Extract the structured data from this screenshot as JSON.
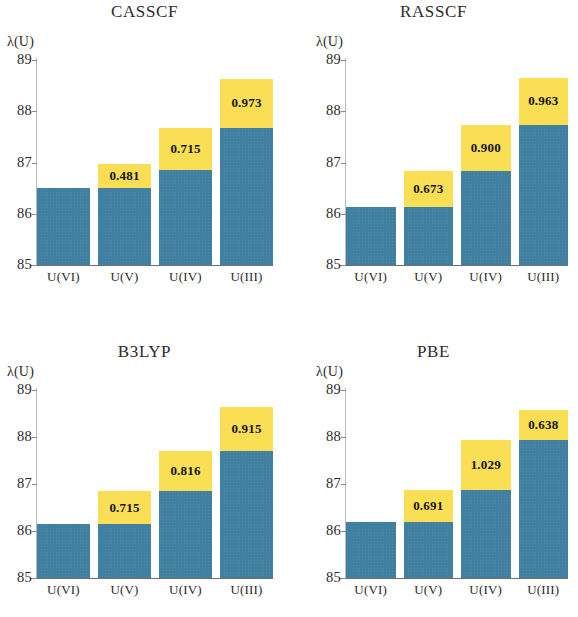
{
  "figure": {
    "ylabel": "λ(U)",
    "categories": [
      "U(VI)",
      "U(V)",
      "U(IV)",
      "U(III)"
    ],
    "yticks": [
      "85",
      "86",
      "87",
      "88",
      "89"
    ],
    "ymin": 85,
    "ymax": 89,
    "colors": {
      "blue": "#3f7f9f",
      "yellow": "#fade53",
      "text": "#2b2b2b",
      "background": "#ffffff"
    }
  },
  "panels": [
    {
      "title": "CASSCF",
      "ylabel": "λ(U)",
      "bars": [
        {
          "category": "U(VI)",
          "blue_top": 86.5,
          "total": 86.5,
          "delta_label": ""
        },
        {
          "category": "U(V)",
          "blue_top": 86.5,
          "total": 86.98,
          "delta_label": "0.481"
        },
        {
          "category": "U(IV)",
          "blue_top": 86.85,
          "total": 87.68,
          "delta_label": "0.715"
        },
        {
          "category": "U(III)",
          "blue_top": 87.68,
          "total": 88.63,
          "delta_label": "0.973"
        }
      ]
    },
    {
      "title": "RASSCF",
      "ylabel": "λ(U)",
      "bars": [
        {
          "category": "U(VI)",
          "blue_top": 86.14,
          "total": 86.14,
          "delta_label": ""
        },
        {
          "category": "U(V)",
          "blue_top": 86.14,
          "total": 86.84,
          "delta_label": "0.673"
        },
        {
          "category": "U(IV)",
          "blue_top": 86.84,
          "total": 87.74,
          "delta_label": "0.900"
        },
        {
          "category": "U(III)",
          "blue_top": 87.74,
          "total": 88.65,
          "delta_label": "0.963"
        }
      ]
    },
    {
      "title": "B3LYP",
      "ylabel": "λ(U)",
      "bars": [
        {
          "category": "U(VI)",
          "blue_top": 86.14,
          "total": 86.14,
          "delta_label": ""
        },
        {
          "category": "U(V)",
          "blue_top": 86.14,
          "total": 86.86,
          "delta_label": "0.715"
        },
        {
          "category": "U(IV)",
          "blue_top": 86.86,
          "total": 87.7,
          "delta_label": "0.816"
        },
        {
          "category": "U(III)",
          "blue_top": 87.7,
          "total": 88.63,
          "delta_label": "0.915"
        }
      ]
    },
    {
      "title": "PBE",
      "ylabel": "λ(U)",
      "bars": [
        {
          "category": "U(VI)",
          "blue_top": 86.2,
          "total": 86.2,
          "delta_label": ""
        },
        {
          "category": "U(V)",
          "blue_top": 86.2,
          "total": 86.88,
          "delta_label": "0.691"
        },
        {
          "category": "U(IV)",
          "blue_top": 86.88,
          "total": 87.94,
          "delta_label": "1.029"
        },
        {
          "category": "U(III)",
          "blue_top": 87.94,
          "total": 88.58,
          "delta_label": "0.638"
        }
      ]
    }
  ],
  "chart_data": {
    "type": "bar",
    "title": "",
    "subtitle": "",
    "xlabel": "",
    "ylabel": "λ(U)",
    "ylim": [
      85,
      89
    ],
    "yticks": [
      85,
      86,
      87,
      88,
      89
    ],
    "grid": false,
    "legend": "none",
    "stacked": true,
    "categories": [
      "U(VI)",
      "U(V)",
      "U(IV)",
      "U(III)"
    ],
    "panels": [
      {
        "title": "CASSCF",
        "series": [
          {
            "name": "base (blue)",
            "values": [
              86.5,
              86.5,
              86.85,
              87.68
            ]
          },
          {
            "name": "total (blue + yellow)",
            "values": [
              86.5,
              86.98,
              87.68,
              88.63
            ]
          }
        ],
        "bar_labels": [
          "",
          "0.481",
          "0.715",
          "0.973"
        ]
      },
      {
        "title": "RASSCF",
        "series": [
          {
            "name": "base (blue)",
            "values": [
              86.14,
              86.14,
              86.84,
              87.74
            ]
          },
          {
            "name": "total (blue + yellow)",
            "values": [
              86.14,
              86.84,
              87.74,
              88.65
            ]
          }
        ],
        "bar_labels": [
          "",
          "0.673",
          "0.900",
          "0.963"
        ]
      },
      {
        "title": "B3LYP",
        "series": [
          {
            "name": "base (blue)",
            "values": [
              86.14,
              86.14,
              86.86,
              87.7
            ]
          },
          {
            "name": "total (blue + yellow)",
            "values": [
              86.14,
              86.86,
              87.7,
              88.63
            ]
          }
        ],
        "bar_labels": [
          "",
          "0.715",
          "0.816",
          "0.915"
        ]
      },
      {
        "title": "PBE",
        "series": [
          {
            "name": "base (blue)",
            "values": [
              86.2,
              86.2,
              86.88,
              87.94
            ]
          },
          {
            "name": "total (blue + yellow)",
            "values": [
              86.2,
              86.88,
              87.94,
              88.58
            ]
          }
        ],
        "bar_labels": [
          "",
          "0.691",
          "1.029",
          "0.638"
        ]
      }
    ]
  }
}
